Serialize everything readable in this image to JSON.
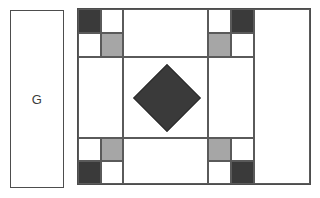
{
  "figure": {
    "width": 320,
    "height": 198,
    "background": "#ffffff"
  },
  "label_panel": {
    "name": "G",
    "letter": "G",
    "x": 10,
    "y": 10,
    "width": 54,
    "height": 178,
    "fill": "#ffffff",
    "stroke": "#4d4d4d"
  },
  "palette": {
    "dark": "#3a3a3a",
    "gray": "#a6a6a6",
    "white": "#ffffff",
    "outline": "#5a5a5a",
    "frame": "#4d4d4d"
  },
  "block": {
    "x": 77,
    "y": 8,
    "width": 234,
    "height": 177,
    "fill": "#ffffff",
    "stroke": "#4d4d4d",
    "columns": [
      45,
      25,
      108,
      56
    ],
    "rows": [
      24,
      24,
      82,
      24,
      23
    ],
    "patches": [
      {
        "id": "tl-nw",
        "role": "corner-checker",
        "corner": "top-left",
        "color": "dark",
        "x": 0,
        "y": 0,
        "w": 23,
        "h": 24
      },
      {
        "id": "tl-ne",
        "role": "corner-checker",
        "corner": "top-left",
        "color": "white",
        "x": 23,
        "y": 0,
        "w": 22,
        "h": 24
      },
      {
        "id": "tl-sw",
        "role": "corner-checker",
        "corner": "top-left",
        "color": "white",
        "x": 0,
        "y": 24,
        "w": 23,
        "h": 24
      },
      {
        "id": "tl-se",
        "role": "corner-checker",
        "corner": "top-left",
        "color": "gray",
        "x": 23,
        "y": 24,
        "w": 22,
        "h": 24
      },
      {
        "id": "tr-nw",
        "role": "corner-checker",
        "corner": "top-right",
        "color": "white",
        "x": 130,
        "y": 0,
        "w": 23,
        "h": 24
      },
      {
        "id": "tr-ne",
        "role": "corner-checker",
        "corner": "top-right",
        "color": "dark",
        "x": 153,
        "y": 0,
        "w": 23,
        "h": 24
      },
      {
        "id": "tr-sw",
        "role": "corner-checker",
        "corner": "top-right",
        "color": "gray",
        "x": 130,
        "y": 24,
        "w": 23,
        "h": 24
      },
      {
        "id": "tr-se",
        "role": "corner-checker",
        "corner": "top-right",
        "color": "white",
        "x": 153,
        "y": 24,
        "w": 23,
        "h": 24
      },
      {
        "id": "bl-nw",
        "role": "corner-checker",
        "corner": "bottom-left",
        "color": "white",
        "x": 0,
        "y": 129,
        "w": 23,
        "h": 23
      },
      {
        "id": "bl-ne",
        "role": "corner-checker",
        "corner": "bottom-left",
        "color": "gray",
        "x": 23,
        "y": 129,
        "w": 22,
        "h": 23
      },
      {
        "id": "bl-sw",
        "role": "corner-checker",
        "corner": "bottom-left",
        "color": "dark",
        "x": 0,
        "y": 152,
        "w": 23,
        "h": 23
      },
      {
        "id": "bl-se",
        "role": "corner-checker",
        "corner": "bottom-left",
        "color": "white",
        "x": 23,
        "y": 152,
        "w": 22,
        "h": 23
      },
      {
        "id": "br-nw",
        "role": "corner-checker",
        "corner": "bottom-right",
        "color": "gray",
        "x": 130,
        "y": 129,
        "w": 23,
        "h": 23
      },
      {
        "id": "br-ne",
        "role": "corner-checker",
        "corner": "bottom-right",
        "color": "white",
        "x": 153,
        "y": 129,
        "w": 23,
        "h": 23
      },
      {
        "id": "br-sw",
        "role": "corner-checker",
        "corner": "bottom-right",
        "color": "white",
        "x": 130,
        "y": 152,
        "w": 23,
        "h": 23
      },
      {
        "id": "br-se",
        "role": "corner-checker",
        "corner": "bottom-right",
        "color": "dark",
        "x": 153,
        "y": 152,
        "w": 23,
        "h": 23
      },
      {
        "id": "top-sash",
        "role": "sash",
        "color": "white",
        "x": 45,
        "y": 0,
        "w": 85,
        "h": 48
      },
      {
        "id": "left-sash",
        "role": "sash",
        "color": "white",
        "x": 0,
        "y": 48,
        "w": 45,
        "h": 81
      },
      {
        "id": "center",
        "role": "center-field",
        "color": "white",
        "x": 45,
        "y": 48,
        "w": 85,
        "h": 81
      },
      {
        "id": "right-sash",
        "role": "sash",
        "color": "white",
        "x": 130,
        "y": 48,
        "w": 46,
        "h": 81
      },
      {
        "id": "bottom-sash",
        "role": "sash",
        "color": "white",
        "x": 45,
        "y": 129,
        "w": 85,
        "h": 46
      },
      {
        "id": "right-column",
        "role": "side-panel",
        "color": "white",
        "x": 176,
        "y": 0,
        "w": 56,
        "h": 175
      }
    ],
    "diamond": {
      "id": "center-diamond",
      "role": "center-diamond",
      "color": "dark",
      "center_x": 89,
      "center_y": 89,
      "side": 48,
      "rotation_deg": 45
    }
  }
}
